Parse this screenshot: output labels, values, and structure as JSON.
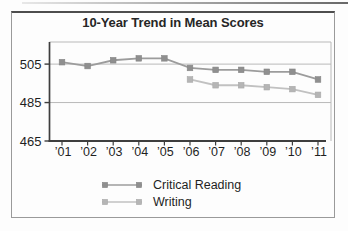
{
  "chart_data": {
    "type": "line",
    "title": "10-Year Trend in Mean Scores",
    "x_labels": [
      "’01",
      "’02",
      "’03",
      "’04",
      "’05",
      "’06",
      "’07",
      "’08",
      "’09",
      "’10",
      "’11"
    ],
    "xlabel": "",
    "ylabel": "",
    "yticks": [
      505,
      485,
      465
    ],
    "ylim": [
      465,
      516.5
    ],
    "gridline_values": [
      505,
      485
    ],
    "grid": "horizontal-only",
    "legend_position": "bottom-center",
    "grid_color": "#b9b9b9",
    "axis_color": "#3e3e3e",
    "text_color": "#1f1f1f",
    "series": [
      {
        "name": "Critical Reading",
        "marker": "square",
        "line_color": "#9c9c9c",
        "marker_color": "#8f8f8f",
        "marker_stroke": "#858585",
        "values": [
          506,
          504,
          507,
          508,
          508,
          503,
          502,
          502,
          501,
          501,
          497
        ]
      },
      {
        "name": "Writing",
        "marker": "square",
        "line_color": "#c1c1c1",
        "marker_color": "#b5b5b5",
        "marker_stroke": "#a9a9a9",
        "values": [
          null,
          null,
          null,
          null,
          null,
          497,
          494,
          494,
          493,
          492,
          489
        ]
      }
    ]
  }
}
